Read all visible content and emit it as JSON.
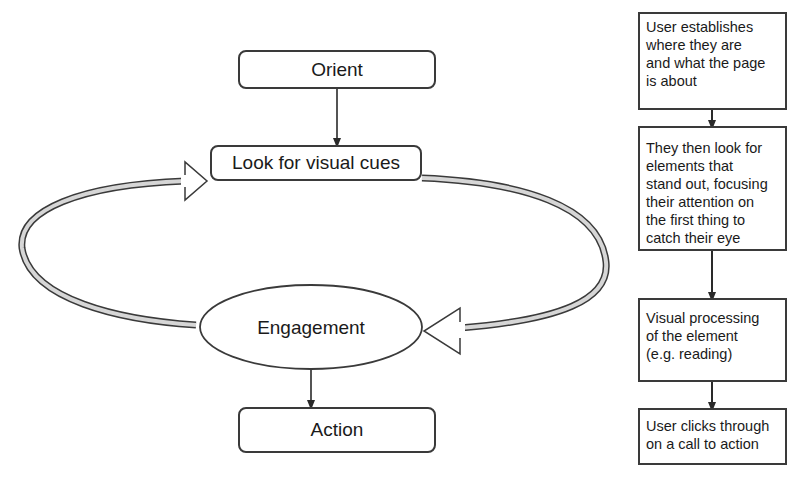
{
  "left_diagram": {
    "nodes": {
      "orient": "Orient",
      "look": "Look for visual cues",
      "engagement": "Engagement",
      "action": "Action"
    },
    "edges": [
      {
        "from": "orient",
        "to": "look",
        "style": "thin-arrow"
      },
      {
        "from": "look",
        "to": "engagement",
        "style": "hollow-loop-arrow",
        "side": "right"
      },
      {
        "from": "engagement",
        "to": "look",
        "style": "hollow-loop-arrow",
        "side": "left"
      },
      {
        "from": "engagement",
        "to": "action",
        "style": "thin-arrow"
      }
    ]
  },
  "right_flow": {
    "steps": [
      {
        "text": "User establishes\nwhere they are\nand what the page\nis about"
      },
      {
        "text": "They then look for\nelements that\nstand out, focusing\ntheir attention on\nthe first thing to\ncatch their eye"
      },
      {
        "text": "Visual processing\nof the element\n(e.g. reading)"
      },
      {
        "text": "User clicks through\non a call to action"
      }
    ]
  },
  "colors": {
    "stroke": "#3a3a3a",
    "loop_fill": "#d6d6d6",
    "background": "#ffffff"
  }
}
